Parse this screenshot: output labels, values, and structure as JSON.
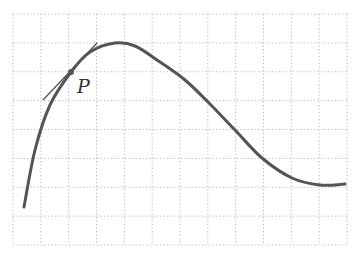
{
  "figure": {
    "point_label": "P",
    "grid": {
      "cols": 12,
      "rows": 8,
      "left": 13,
      "top": 14,
      "right": 347,
      "bottom": 245
    },
    "colors": {
      "curve": "#555555",
      "tangent": "#555555",
      "grid": "#b5b5b5",
      "point": "#555555"
    },
    "curve_points": [
      [
        24,
        207
      ],
      [
        35,
        150
      ],
      [
        50,
        105
      ],
      [
        71,
        72
      ],
      [
        90,
        52
      ],
      [
        115,
        43
      ],
      [
        135,
        46
      ],
      [
        160,
        62
      ],
      [
        185,
        80
      ],
      [
        208,
        102
      ],
      [
        235,
        130
      ],
      [
        262,
        158
      ],
      [
        292,
        178
      ],
      [
        320,
        185
      ],
      [
        345,
        184
      ]
    ],
    "point": [
      71,
      72
    ],
    "tangent": [
      [
        43,
        100
      ],
      [
        97,
        43
      ]
    ],
    "label_position": [
      77,
      93
    ]
  }
}
